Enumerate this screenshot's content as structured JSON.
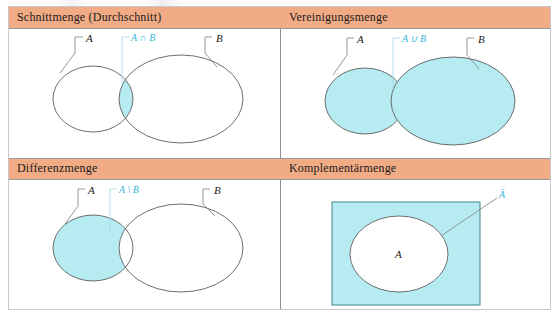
{
  "figure": {
    "title_implicit": "Mengenoperationen",
    "colors": {
      "header_band": "#f1ac86",
      "set_fill": "#b6ebf2",
      "outline": "#5d5d5d",
      "label_accent": "#35b6d8",
      "table_border": "#c9c9c9",
      "divider": "#8d8d8d"
    }
  },
  "panels": [
    {
      "id": "intersection",
      "header": "Schnittmenge (Durchschnitt)",
      "labels": {
        "left_set": "A",
        "right_set": "B",
        "operation": "A ∩ B"
      },
      "shaded_region": "A ∩ B"
    },
    {
      "id": "union",
      "header": "Vereinigungsmenge",
      "labels": {
        "left_set": "A",
        "right_set": "B",
        "operation": "A ∪ B"
      },
      "shaded_region": "A ∪ B"
    },
    {
      "id": "difference",
      "header": "Differenzmenge",
      "labels": {
        "left_set": "A",
        "right_set": "B",
        "operation": "A \\ B"
      },
      "shaded_region": "A \\ B"
    },
    {
      "id": "complement",
      "header": "Komplementärmenge",
      "labels": {
        "inner_set": "A",
        "operation": "Ā"
      },
      "shaded_region": "complement of A"
    }
  ]
}
